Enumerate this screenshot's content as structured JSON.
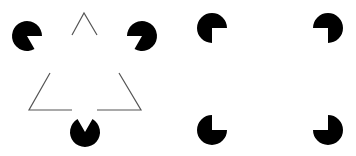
{
  "figures": [
    {
      "name": "kanizsa-triangle",
      "fill_color": "#000000",
      "line_color": "#555555",
      "inducers": [
        {
          "cx": 27,
          "cy": 36,
          "r": 15,
          "mouth_start_deg": 0,
          "mouth_end_deg": 60
        },
        {
          "cx": 142,
          "cy": 36,
          "r": 15,
          "mouth_start_deg": 120,
          "mouth_end_deg": 180
        },
        {
          "cx": 85,
          "cy": 132,
          "r": 15,
          "mouth_start_deg": 240,
          "mouth_end_deg": 300
        }
      ],
      "outline_segments": [
        {
          "points": "72,35 84,13 97,35"
        },
        {
          "points": "50,73 29,110 72,110"
        },
        {
          "points": "119,73 141,110 97,110"
        }
      ]
    },
    {
      "name": "kanizsa-square",
      "fill_color": "#000000",
      "inducers": [
        {
          "cx": 212,
          "cy": 28,
          "r": 15,
          "mouth_start_deg": 0,
          "mouth_end_deg": 90
        },
        {
          "cx": 328,
          "cy": 28,
          "r": 15,
          "mouth_start_deg": 90,
          "mouth_end_deg": 180
        },
        {
          "cx": 212,
          "cy": 130,
          "r": 15,
          "mouth_start_deg": 270,
          "mouth_end_deg": 360
        },
        {
          "cx": 328,
          "cy": 130,
          "r": 15,
          "mouth_start_deg": 180,
          "mouth_end_deg": 270
        }
      ]
    }
  ]
}
